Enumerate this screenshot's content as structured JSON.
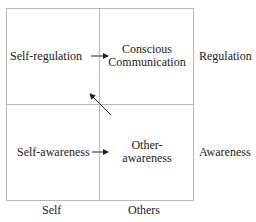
{
  "quadrants": {
    "top_left": "Self-regulation",
    "top_right_line1": "Conscious",
    "top_right_line2": "Communication",
    "bottom_left": "Self-awareness",
    "bottom_right_line1": "Other-",
    "bottom_right_line2": "awareness"
  },
  "row_labels": {
    "top": "Regulation",
    "bottom": "Awareness"
  },
  "column_labels": {
    "left": "Self",
    "right": "Others"
  },
  "colors": {
    "grid_line": "#b8b8b8",
    "text": "#222222",
    "arrow": "#222222"
  }
}
